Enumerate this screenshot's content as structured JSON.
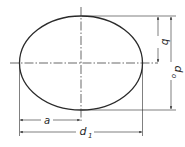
{
  "diagram": {
    "type": "technical-drawing",
    "labels": {
      "a": "a",
      "b": "b",
      "d0": "d",
      "d0_sub": "o",
      "d1": "d",
      "d1_sub": "1"
    },
    "colors": {
      "line": "#2a2a2a",
      "background": "#ffffff"
    }
  }
}
